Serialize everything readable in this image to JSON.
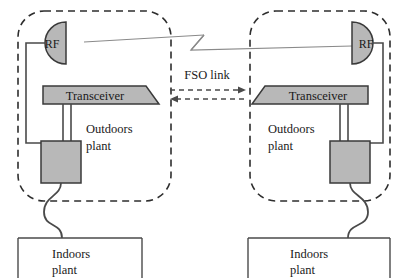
{
  "diagram": {
    "colors": {
      "shape_fill": "#b8b8b8",
      "shape_stroke": "#3a3a3a",
      "line": "#4a4a4a",
      "dashed_boundary": "#2e2e2e",
      "text": "#1a1a1a",
      "background": "#ffffff"
    },
    "link_label": "FSO link",
    "nodes": {
      "left": {
        "rf_label": "RF",
        "transceiver_label": "Transceiver",
        "outdoors_label_line1": "Outdoors",
        "outdoors_label_line2": "plant",
        "indoors_label_line1": "Indoors",
        "indoors_label_line2": "plant"
      },
      "right": {
        "rf_label": "RF",
        "transceiver_label": "Transceiver",
        "outdoors_label_line1": "Outdoors",
        "outdoors_label_line2": "plant",
        "indoors_label_line1": "Indoors",
        "indoors_label_line2": "plant"
      }
    },
    "icons": {
      "rf_antenna": "rf-antenna-icon",
      "transceiver": "transceiver-icon",
      "equipment_box": "equipment-box-icon",
      "fiber_cable": "wavy-cable-icon",
      "rf_link_break": "line-break-zigzag-icon",
      "fso_arrow_right": "arrow-right-icon",
      "fso_arrow_left": "arrow-left-icon"
    }
  }
}
